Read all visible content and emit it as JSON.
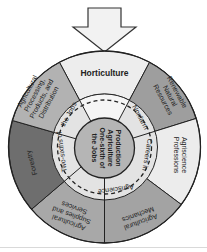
{
  "diagram": {
    "arrow": {
      "label": "",
      "direction": "down",
      "fill": "#f2f2f2"
    },
    "outer_ring": {
      "segments": [
        {
          "label_lines": [
            "Horticulture"
          ],
          "fill": "#ededed"
        },
        {
          "label_lines": [
            "Renewable",
            "Natural",
            "Resources"
          ],
          "fill": "#9e9e9e"
        },
        {
          "label_lines": [
            "Agriscience",
            "Professions"
          ],
          "fill": "#ececec"
        },
        {
          "label_lines": [
            "Agricultural",
            "Mechanics"
          ],
          "fill": "#a3a3a3"
        },
        {
          "label_lines": [
            "Agricultural",
            "Supplies and",
            "Services"
          ],
          "fill": "#a8a8a8"
        },
        {
          "label_lines": [
            "Forestry"
          ],
          "fill": "#6e6e6e"
        },
        {
          "label_lines": [
            "Agricultural",
            "Processing,",
            "Products, and",
            "Distribution"
          ],
          "fill": "#b2b2b2"
        }
      ]
    },
    "middle_ring": {
      "labels": {
        "nonfarm": "Nonfarm",
        "careers_in": "Careers in",
        "agriscience": "Agriscience",
        "two_sixths": "Two-sixths of",
        "the_jobs": "the Jobs"
      },
      "fill": "#e3e3e3"
    },
    "center": {
      "lines": [
        "Production",
        "Agriculture",
        "One-sixth of",
        "the Jobs"
      ],
      "fill": "#b5b5b5"
    }
  }
}
